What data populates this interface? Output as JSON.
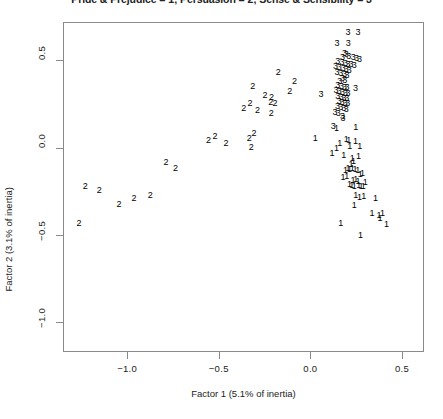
{
  "chart_data": {
    "type": "scatter",
    "title": "Pride & Prejudice = 1; Persuasion = 2; Sense & Sensibility = 3",
    "xlabel": "Factor 1 (5.1% of inertia)",
    "ylabel": "Factor 2 (3.1% of inertia)",
    "xlim": [
      -1.35,
      0.62
    ],
    "ylim": [
      -1.17,
      0.72
    ],
    "xticks": [
      -1.0,
      -0.5,
      0.0,
      0.5
    ],
    "xtick_labels": [
      "−1.0",
      "−0.5",
      "0.0",
      "0.5"
    ],
    "yticks": [
      0.5,
      0.0,
      -0.5,
      -1.0
    ],
    "ytick_labels": [
      "0.5",
      "0.0",
      "−0.5",
      "−1.0"
    ],
    "grid": false,
    "legend": "none",
    "marker_style": "text-label",
    "groups": [
      {
        "name": "Pride & Prejudice",
        "label": "1"
      },
      {
        "name": "Persuasion",
        "label": "2"
      },
      {
        "name": "Sense & Sensibility",
        "label": "3"
      }
    ],
    "points": [
      {
        "label": "3",
        "x": 0.205,
        "y": 0.66
      },
      {
        "label": "3",
        "x": 0.26,
        "y": 0.66
      },
      {
        "label": "3",
        "x": 0.145,
        "y": 0.6
      },
      {
        "label": "3",
        "x": 0.207,
        "y": 0.598
      },
      {
        "label": "3",
        "x": 0.186,
        "y": 0.54
      },
      {
        "label": "3",
        "x": 0.196,
        "y": 0.534
      },
      {
        "label": "3",
        "x": 0.21,
        "y": 0.528
      },
      {
        "label": "3",
        "x": 0.176,
        "y": 0.522
      },
      {
        "label": "3",
        "x": 0.234,
        "y": 0.518
      },
      {
        "label": "3",
        "x": 0.252,
        "y": 0.512
      },
      {
        "label": "3",
        "x": 0.268,
        "y": 0.508
      },
      {
        "label": "3",
        "x": 0.15,
        "y": 0.494
      },
      {
        "label": "3",
        "x": 0.172,
        "y": 0.49
      },
      {
        "label": "3",
        "x": 0.192,
        "y": 0.486
      },
      {
        "label": "3",
        "x": 0.205,
        "y": 0.482
      },
      {
        "label": "3",
        "x": 0.222,
        "y": 0.478
      },
      {
        "label": "3",
        "x": 0.24,
        "y": 0.474
      },
      {
        "label": "3",
        "x": 0.137,
        "y": 0.47
      },
      {
        "label": "3",
        "x": 0.158,
        "y": 0.464
      },
      {
        "label": "3",
        "x": 0.18,
        "y": 0.458
      },
      {
        "label": "3",
        "x": 0.196,
        "y": 0.452
      },
      {
        "label": "3",
        "x": 0.212,
        "y": 0.446
      },
      {
        "label": "3",
        "x": 0.146,
        "y": 0.436
      },
      {
        "label": "3",
        "x": 0.166,
        "y": 0.43
      },
      {
        "label": "3",
        "x": 0.186,
        "y": 0.424
      },
      {
        "label": "3",
        "x": 0.2,
        "y": 0.418
      },
      {
        "label": "3",
        "x": 0.176,
        "y": 0.4
      },
      {
        "label": "3",
        "x": 0.188,
        "y": 0.39
      },
      {
        "label": "3",
        "x": 0.16,
        "y": 0.382
      },
      {
        "label": "3",
        "x": 0.15,
        "y": 0.36
      },
      {
        "label": "3",
        "x": 0.17,
        "y": 0.354
      },
      {
        "label": "3",
        "x": 0.186,
        "y": 0.35
      },
      {
        "label": "3",
        "x": 0.2,
        "y": 0.346
      },
      {
        "label": "3",
        "x": 0.246,
        "y": 0.344
      },
      {
        "label": "3",
        "x": 0.14,
        "y": 0.332
      },
      {
        "label": "3",
        "x": 0.158,
        "y": 0.326
      },
      {
        "label": "3",
        "x": 0.176,
        "y": 0.32
      },
      {
        "label": "3",
        "x": 0.192,
        "y": 0.316
      },
      {
        "label": "3",
        "x": 0.206,
        "y": 0.312
      },
      {
        "label": "3",
        "x": 0.058,
        "y": 0.308
      },
      {
        "label": "3",
        "x": 0.15,
        "y": 0.296
      },
      {
        "label": "3",
        "x": 0.168,
        "y": 0.29
      },
      {
        "label": "3",
        "x": 0.184,
        "y": 0.286
      },
      {
        "label": "3",
        "x": 0.198,
        "y": 0.282
      },
      {
        "label": "3",
        "x": 0.158,
        "y": 0.268
      },
      {
        "label": "3",
        "x": 0.174,
        "y": 0.262
      },
      {
        "label": "3",
        "x": 0.19,
        "y": 0.258
      },
      {
        "label": "3",
        "x": 0.204,
        "y": 0.254
      },
      {
        "label": "3",
        "x": 0.148,
        "y": 0.24
      },
      {
        "label": "3",
        "x": 0.166,
        "y": 0.234
      },
      {
        "label": "3",
        "x": 0.182,
        "y": 0.228
      },
      {
        "label": "3",
        "x": 0.196,
        "y": 0.224
      },
      {
        "label": "3",
        "x": 0.134,
        "y": 0.206
      },
      {
        "label": "3",
        "x": 0.152,
        "y": 0.2
      },
      {
        "label": "3",
        "x": 0.176,
        "y": 0.18
      },
      {
        "label": "3",
        "x": 0.178,
        "y": 0.172
      },
      {
        "label": "3",
        "x": 0.125,
        "y": 0.122
      },
      {
        "label": "1",
        "x": 0.142,
        "y": 0.112
      },
      {
        "label": "1",
        "x": 0.248,
        "y": 0.118
      },
      {
        "label": "1",
        "x": 0.196,
        "y": 0.05
      },
      {
        "label": "1",
        "x": 0.21,
        "y": 0.044
      },
      {
        "label": "1",
        "x": 0.246,
        "y": 0.04
      },
      {
        "label": "1",
        "x": 0.16,
        "y": 0.026
      },
      {
        "label": "1",
        "x": 0.215,
        "y": 0.012
      },
      {
        "label": "1",
        "x": 0.27,
        "y": 0.01
      },
      {
        "label": "1",
        "x": 0.142,
        "y": -0.002
      },
      {
        "label": "1",
        "x": 0.118,
        "y": -0.028
      },
      {
        "label": "1",
        "x": 0.182,
        "y": -0.044
      },
      {
        "label": "1",
        "x": 0.262,
        "y": -0.05
      },
      {
        "label": "1",
        "x": 0.228,
        "y": -0.06
      },
      {
        "label": "1",
        "x": 0.236,
        "y": -0.078
      },
      {
        "label": "1",
        "x": 0.222,
        "y": -0.092
      },
      {
        "label": "1",
        "x": 0.206,
        "y": -0.114
      },
      {
        "label": "1",
        "x": 0.214,
        "y": -0.12
      },
      {
        "label": "1",
        "x": 0.229,
        "y": -0.118
      },
      {
        "label": "1",
        "x": 0.244,
        "y": -0.122
      },
      {
        "label": "1",
        "x": 0.258,
        "y": -0.128
      },
      {
        "label": "1",
        "x": 0.192,
        "y": -0.13
      },
      {
        "label": "1",
        "x": 0.272,
        "y": -0.15
      },
      {
        "label": "1",
        "x": 0.284,
        "y": -0.146
      },
      {
        "label": "1",
        "x": 0.198,
        "y": -0.16
      },
      {
        "label": "1",
        "x": 0.178,
        "y": -0.168
      },
      {
        "label": "1",
        "x": 0.233,
        "y": -0.186
      },
      {
        "label": "1",
        "x": 0.247,
        "y": -0.182
      },
      {
        "label": "1",
        "x": 0.26,
        "y": -0.188
      },
      {
        "label": "1",
        "x": 0.3,
        "y": -0.196
      },
      {
        "label": "1",
        "x": 0.213,
        "y": -0.21
      },
      {
        "label": "1",
        "x": 0.226,
        "y": -0.214
      },
      {
        "label": "1",
        "x": 0.24,
        "y": -0.218
      },
      {
        "label": "1",
        "x": 0.264,
        "y": -0.216
      },
      {
        "label": "1",
        "x": 0.276,
        "y": -0.22
      },
      {
        "label": "1",
        "x": 0.288,
        "y": -0.218
      },
      {
        "label": "1",
        "x": 0.248,
        "y": -0.272
      },
      {
        "label": "1",
        "x": 0.268,
        "y": -0.28
      },
      {
        "label": "1",
        "x": 0.292,
        "y": -0.278
      },
      {
        "label": "1",
        "x": 0.355,
        "y": -0.288
      },
      {
        "label": "1",
        "x": 0.24,
        "y": -0.33
      },
      {
        "label": "1",
        "x": 0.336,
        "y": -0.372
      },
      {
        "label": "1",
        "x": 0.374,
        "y": -0.384
      },
      {
        "label": "1",
        "x": 0.394,
        "y": -0.374
      },
      {
        "label": "1",
        "x": 0.38,
        "y": -0.404
      },
      {
        "label": "1",
        "x": 0.416,
        "y": -0.436
      },
      {
        "label": "1",
        "x": 0.166,
        "y": -0.43
      },
      {
        "label": "1",
        "x": 0.274,
        "y": -0.498
      },
      {
        "label": "1",
        "x": 0.026,
        "y": 0.058
      },
      {
        "label": "2",
        "x": -0.175,
        "y": 0.432
      },
      {
        "label": "2",
        "x": -0.315,
        "y": 0.356
      },
      {
        "label": "2",
        "x": -0.086,
        "y": 0.38
      },
      {
        "label": "2",
        "x": -0.248,
        "y": 0.3
      },
      {
        "label": "2",
        "x": -0.212,
        "y": 0.292
      },
      {
        "label": "2",
        "x": -0.113,
        "y": 0.324
      },
      {
        "label": "2",
        "x": -0.33,
        "y": 0.258
      },
      {
        "label": "2",
        "x": -0.216,
        "y": 0.262
      },
      {
        "label": "2",
        "x": -0.193,
        "y": 0.254
      },
      {
        "label": "2",
        "x": -0.363,
        "y": 0.23
      },
      {
        "label": "2",
        "x": -0.288,
        "y": 0.216
      },
      {
        "label": "2",
        "x": -0.214,
        "y": 0.196
      },
      {
        "label": "2",
        "x": -0.52,
        "y": 0.068
      },
      {
        "label": "2",
        "x": -0.556,
        "y": 0.042
      },
      {
        "label": "2",
        "x": -0.46,
        "y": 0.028
      },
      {
        "label": "2",
        "x": -0.308,
        "y": 0.082
      },
      {
        "label": "2",
        "x": -0.334,
        "y": 0.056
      },
      {
        "label": "2",
        "x": -0.322,
        "y": 0.004
      },
      {
        "label": "2",
        "x": -0.788,
        "y": -0.084
      },
      {
        "label": "2",
        "x": -0.736,
        "y": -0.114
      },
      {
        "label": "2",
        "x": -1.228,
        "y": -0.218
      },
      {
        "label": "2",
        "x": -1.152,
        "y": -0.24
      },
      {
        "label": "2",
        "x": -0.963,
        "y": -0.288
      },
      {
        "label": "2",
        "x": -0.874,
        "y": -0.27
      },
      {
        "label": "2",
        "x": -1.044,
        "y": -0.322
      },
      {
        "label": "2",
        "x": -1.262,
        "y": -0.43
      }
    ]
  }
}
